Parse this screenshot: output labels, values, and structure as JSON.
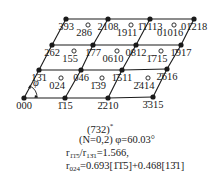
{
  "diagram": {
    "type": "reciprocal-lattice-section",
    "colors": {
      "ink": "#1a1a1a",
      "background": "#ffffff"
    },
    "nodes": [
      {
        "id": "000",
        "label": "000",
        "row": 0,
        "col": 0,
        "x": 24,
        "y": 98,
        "label_pos": "below"
      },
      {
        "id": "1115",
        "label": "1̄15",
        "row": 0,
        "col": 1,
        "x": 65,
        "y": 98,
        "label_pos": "below"
      },
      {
        "id": "2210",
        "label": "2̄210",
        "row": 0,
        "col": 2,
        "x": 108,
        "y": 98,
        "label_pos": "below"
      },
      {
        "id": "3315",
        "label": "3̄315",
        "row": 0,
        "col": 3,
        "x": 153,
        "y": 97,
        "label_pos": "below"
      },
      {
        "id": "131",
        "label": "13̄1",
        "row": 1,
        "col": 0,
        "x": 39,
        "y": 70,
        "label_pos": "below"
      },
      {
        "id": "046",
        "label": "046",
        "row": 1,
        "col": 1,
        "x": 81,
        "y": 70,
        "label_pos": "below"
      },
      {
        "id": "1511",
        "label": "1̄511",
        "row": 1,
        "col": 2,
        "x": 122,
        "y": 70,
        "label_pos": "below"
      },
      {
        "id": "2616",
        "label": "2̄616",
        "row": 1,
        "col": 3,
        "x": 167,
        "y": 69,
        "label_pos": "below"
      },
      {
        "id": "262",
        "label": "262",
        "row": 2,
        "col": 0,
        "x": 52,
        "y": 45,
        "label_pos": "below"
      },
      {
        "id": "177",
        "label": "1̄77",
        "row": 2,
        "col": 1,
        "x": 93,
        "y": 45,
        "label_pos": "below"
      },
      {
        "id": "0812",
        "label": "0812",
        "row": 2,
        "col": 2,
        "x": 136,
        "y": 45,
        "label_pos": "below"
      },
      {
        "id": "1917",
        "label": "1̄917",
        "row": 2,
        "col": 3,
        "x": 181,
        "y": 45,
        "label_pos": "below"
      },
      {
        "id": "393",
        "label": "393",
        "row": 3,
        "col": 0,
        "x": 66,
        "y": 19,
        "label_pos": "below"
      },
      {
        "id": "2108",
        "label": "2108",
        "row": 3,
        "col": 1,
        "x": 108,
        "y": 19,
        "label_pos": "below"
      },
      {
        "id": "11113",
        "label": "1̄1113",
        "row": 3,
        "col": 2,
        "x": 150,
        "y": 19,
        "label_pos": "below"
      },
      {
        "id": "01218",
        "label": "01̄218",
        "row": 3,
        "col": 3,
        "x": 194,
        "y": 19,
        "label_pos": "below"
      }
    ],
    "extra_spots": [
      {
        "label": "024",
        "x": 57,
        "y": 85
      },
      {
        "label": "1̄39",
        "x": 98,
        "y": 85
      },
      {
        "label": "2̄414",
        "x": 144,
        "y": 85
      },
      {
        "label": "155",
        "x": 70,
        "y": 58
      },
      {
        "label": "0610",
        "x": 113,
        "y": 58
      },
      {
        "label": "1̄715",
        "x": 157,
        "y": 58
      },
      {
        "label": "286",
        "x": 84,
        "y": 32
      },
      {
        "label": "1911",
        "x": 127,
        "y": 32
      },
      {
        "label": "01016",
        "x": 170,
        "y": 32
      }
    ],
    "angle_marker": {
      "symbol": "φ",
      "x": 30,
      "y": 86
    }
  },
  "caption": {
    "zone_axis": "(732)",
    "zone_axis_superscript": "*",
    "params": "(N=0,2)  φ=60.03°",
    "ratio_line": {
      "prefix": "r",
      "sub1": "1̄1̄5",
      "mid": "/r",
      "sub2": "13̄1",
      "value": "=1.566,"
    },
    "vector_line": {
      "prefix": "r",
      "sub": "024",
      "value": "=0.693[1̄1̄5]+0.468[13̄1]"
    }
  }
}
